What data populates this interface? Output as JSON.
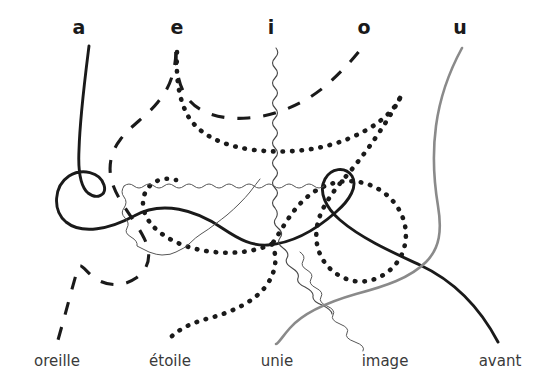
{
  "figure": {
    "background_color": "#ffffff",
    "width": 549,
    "height": 392
  },
  "top_labels": [
    {
      "text": "a",
      "x": 79,
      "y": 18
    },
    {
      "text": "e",
      "x": 177,
      "y": 18
    },
    {
      "text": "i",
      "x": 271,
      "y": 18
    },
    {
      "text": "o",
      "x": 364,
      "y": 18
    },
    {
      "text": "u",
      "x": 460,
      "y": 18
    }
  ],
  "bottom_labels": [
    {
      "text": "oreille",
      "x": 57,
      "y": 354
    },
    {
      "text": "étoile",
      "x": 170,
      "y": 354
    },
    {
      "text": "unie",
      "x": 277,
      "y": 354
    },
    {
      "text": "image",
      "x": 385,
      "y": 354
    },
    {
      "text": "avant",
      "x": 500,
      "y": 354
    }
  ],
  "curves": [
    {
      "id": "curve-a",
      "from_vowel": "a",
      "to_word": "avant",
      "style": "solid",
      "color": "#1a1a1a",
      "width": 2.9,
      "dasharray": "none",
      "path": "M 88 47 C 84 80, 78 120, 78 160 C 78 178, 82 192, 95 198 C 110 205, 118 196, 110 186 C 99 172, 78 172, 66 180 C 52 190, 52 212, 66 222 C 82 234, 108 228, 130 216 C 160 200, 190 212, 218 230 C 236 242, 250 248, 268 247 C 296 245, 318 230, 338 214 C 352 202, 360 188, 354 178 C 348 169, 334 170, 328 180 C 321 192, 327 208, 340 220 C 360 238, 392 252, 420 264 C 452 278, 478 300, 496 340"
    },
    {
      "id": "curve-e",
      "from_vowel": "e",
      "to_word": "oreille",
      "style": "dashed",
      "color": "#1a1a1a",
      "width": 3.1,
      "dasharray": "13 13",
      "path": "M 180 47 C 179 70, 182 92, 194 108 C 208 126, 232 130, 258 126 C 286 122, 312 108, 334 88 C 348 75, 356 60, 362 48 M 180 47 C 179 70, 176 86, 166 100 C 154 116, 136 124, 120 138 C 108 149, 100 162, 100 176 C 100 196, 112 214, 124 234 C 136 254, 140 268, 128 282 C 116 295, 98 294, 86 284 C 76 276, 70 266, 64 300 C 60 320, 58 332, 57 341"
    },
    {
      "id": "curve-o",
      "from_vowel": "o",
      "to_word": "oreille-dash",
      "style": "dashed",
      "color": "#1a1a1a",
      "width": 3.1,
      "dasharray": "13 13",
      "path": "M 362 48 C 346 62, 328 76, 310 90 C 290 105, 268 118, 246 126 C 224 133, 202 132, 188 120 C 176 110, 172 96, 172 80"
    },
    {
      "id": "curve-i",
      "from_vowel": "i",
      "to_word": "étoile",
      "style": "dotted",
      "color": "#1a1a1a",
      "width": 4.6,
      "dasharray": "0.5 9",
      "path": "M 176 50 C 174 76, 176 98, 186 116 C 198 136, 222 146, 252 150 C 286 154, 322 150, 352 138 C 378 128, 396 114, 404 98 M 186 116 C 200 138, 216 158, 232 176 C 248 194, 262 210, 274 228 C 286 246, 292 262, 290 278 C 288 296, 276 310, 262 318 C 246 327, 228 328, 212 322 C 196 316, 184 302, 176 286 C 170 272, 168 258, 172 246"
    },
    {
      "id": "curve-i2",
      "from_vowel": "i",
      "to_word": "étoile-tail",
      "style": "dotted",
      "color": "#1a1a1a",
      "width": 4.6,
      "dasharray": "0.5 9",
      "path": "M 404 98 C 392 124, 376 150, 358 174 C 338 200, 316 226, 292 248 C 268 270, 242 290, 216 304 C 196 315, 180 324, 170 336"
    },
    {
      "id": "curve-squiggle",
      "from_vowel": "i",
      "to_word": "image",
      "style": "wavy",
      "color": "#444444",
      "width": 1.0,
      "dasharray": "none",
      "path": "wavy-generated"
    },
    {
      "id": "curve-u",
      "from_vowel": "u",
      "to_word": "unie",
      "style": "solid",
      "color": "#8a8a8a",
      "width": 2.6,
      "dasharray": "none",
      "path": "M 462 48 C 450 70, 440 96, 436 126 C 432 156, 434 182, 438 206 C 442 230, 442 246, 430 260 C 416 276, 392 284, 362 292 C 332 300, 306 310, 290 328 C 280 338, 276 345, 274 341"
    }
  ],
  "legend": {
    "note": "Five vowel sounds connected by curves to French example words"
  }
}
